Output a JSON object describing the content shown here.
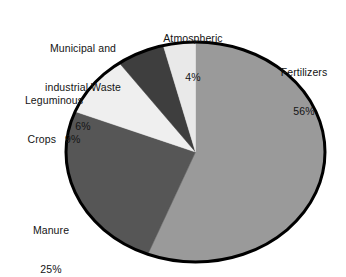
{
  "chart_data": {
    "type": "pie",
    "title": "",
    "subtitle": "",
    "xlabel": "",
    "ylabel": "",
    "grid": false,
    "legend_position": "none",
    "label_style": "external-text-no-leader-lines",
    "start_angle_deg": 90,
    "direction": "first-slice-clockwise-from-top-remainder-counterclockwise",
    "categories": [
      "Fertilizers",
      "Manure",
      "Leguminous Crops",
      "Municipal and industrial Waste",
      "Atmospheric"
    ],
    "values": [
      56,
      25,
      9,
      6,
      4
    ],
    "value_unit": "%",
    "total": 100,
    "slices": [
      {
        "name": "Fertilizers",
        "label_line1": "Fertilizers",
        "label_line2": "56%",
        "value": 56,
        "value_text": "56%",
        "color": "#9a9a9a"
      },
      {
        "name": "Manure",
        "label_line1": "Manure",
        "label_line2": "25%",
        "value": 25,
        "value_text": "25%",
        "color": "#565656"
      },
      {
        "name": "Leguminous Crops",
        "label_line1": "Leguminous",
        "label_line2": "Crops   9%",
        "value": 9,
        "value_text": "9%",
        "color": "#efefef"
      },
      {
        "name": "Municipal and industrial Waste",
        "label_line1": "Municipal and",
        "label_line2": "industrial Waste",
        "label_line3": "6%",
        "value": 6,
        "value_text": "6%",
        "color": "#3e3e3e"
      },
      {
        "name": "Atmospheric",
        "label_line1": "Atmospheric",
        "label_line2": "4%",
        "value": 4,
        "value_text": "4%",
        "color": "#e9e9e9"
      }
    ],
    "outline_color": "#000000",
    "background_color": "#ffffff"
  },
  "labels": {
    "atmospheric": {
      "name": "Atmospheric",
      "percent": "4%"
    },
    "municipal": {
      "line1": "Municipal and",
      "line2": "industrial Waste",
      "percent": "6%"
    },
    "leguminous": {
      "line1": "Leguminous",
      "line2": "Crops   9%"
    },
    "manure": {
      "name": "Manure",
      "percent": "25%"
    },
    "fertilizers": {
      "name": "Fertilizers",
      "percent": "56%"
    }
  }
}
